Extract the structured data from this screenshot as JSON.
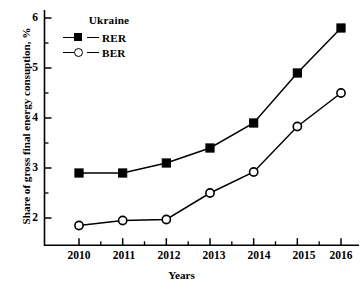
{
  "chart_data": {
    "type": "line",
    "title": "",
    "xlabel": "Years",
    "ylabel": "Share of gross final energy consuption, %",
    "categories": [
      "2010",
      "2011",
      "2012",
      "2013",
      "2014",
      "2015",
      "2016"
    ],
    "x": [
      2010,
      2011,
      2012,
      2013,
      2014,
      2015,
      2016
    ],
    "xlim": [
      2009.5,
      2016.5
    ],
    "ylim": [
      1.55,
      6.0
    ],
    "yticks": [
      2,
      3,
      4,
      5,
      6
    ],
    "yticks_minor": [
      2.5,
      3.5,
      4.5,
      5.5
    ],
    "grid": false,
    "legend_position": "top-left",
    "legend_title": "Ukraine",
    "series": [
      {
        "name": "RER",
        "marker": "filled-square",
        "color": "#000000",
        "values": [
          2.9,
          2.9,
          3.1,
          3.4,
          3.9,
          4.9,
          5.8
        ]
      },
      {
        "name": "BER",
        "marker": "open-circle",
        "color": "#000000",
        "values": [
          1.85,
          1.95,
          1.97,
          2.5,
          2.92,
          3.83,
          4.5
        ]
      }
    ]
  },
  "axis": {
    "y_title": "Share of gross final energy consuption, %",
    "x_title": "Years",
    "y_tick_labels": [
      "6",
      "5",
      "4",
      "3",
      "2"
    ],
    "x_tick_labels": [
      "2010",
      "2011",
      "2012",
      "2013",
      "2014",
      "2015",
      "2016"
    ]
  },
  "legend": {
    "title": "Ukraine",
    "entries": [
      {
        "label": "RER",
        "marker": "filled-square-icon"
      },
      {
        "label": "BER",
        "marker": "open-circle-icon"
      }
    ]
  }
}
